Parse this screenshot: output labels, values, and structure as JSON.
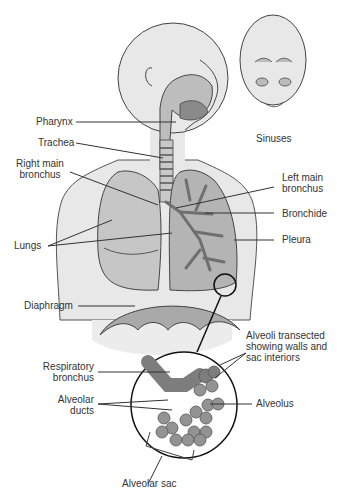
{
  "diagram": {
    "labels": {
      "pharynx": "Pharynx",
      "trachea": "Trachea",
      "right_main_bronchus_1": "Right main",
      "right_main_bronchus_2": "bronchus",
      "lungs": "Lungs",
      "diaphragm": "Diaphragm",
      "sinuses": "Sinuses",
      "left_main_bronchus_1": "Left main",
      "left_main_bronchus_2": "bronchus",
      "bronchide": "Bronchide",
      "pleura": "Pleura",
      "alveoli_1": "Alveoli transected",
      "alveoli_2": "showing walls and",
      "alveoli_3": "sac interiors",
      "respiratory_bronchus_1": "Respiratory",
      "respiratory_bronchus_2": "bronchus",
      "alveolar_ducts_1": "Alveolar",
      "alveolar_ducts_2": "ducts",
      "alveolus": "Alveolus",
      "alveolar_sac": "Alveolar sac"
    },
    "colors": {
      "skin": "#e8e8e8",
      "outline": "#333333",
      "lung_fill": "#b9b9b9",
      "lung_dark": "#9a9a9a",
      "alveoli_fill": "#8f8f8f",
      "airway": "#7d7d7d"
    }
  }
}
